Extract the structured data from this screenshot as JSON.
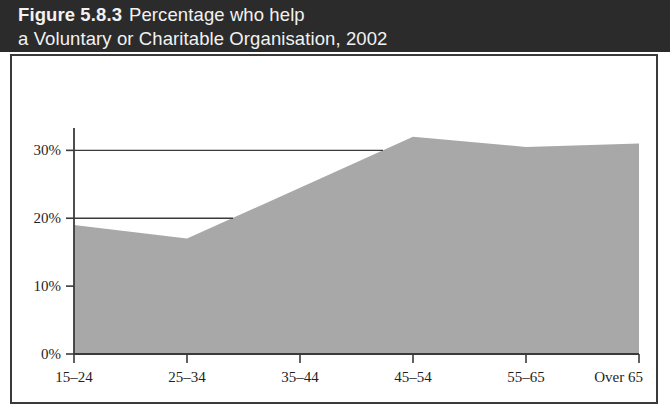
{
  "title": {
    "label": "Figure 5.8.3",
    "line1_rest": "Percentage who help",
    "line2": "a Voluntary or Charitable Organisation, 2002"
  },
  "colors": {
    "title_band": "#2b2b2b",
    "title_text": "#f2f2f2",
    "panel_border": "#3a3a3a",
    "area_fill": "#a8a8a8",
    "axis": "#3a3a3a",
    "gridline": "#3a3a3a",
    "panel_background": "#ffffff"
  },
  "chart_data": {
    "type": "area",
    "xlabel": "",
    "ylabel": "",
    "categories": [
      "15–24",
      "25–34",
      "35–44",
      "45–54",
      "55–65",
      "Over 65"
    ],
    "values": [
      19,
      17,
      24.5,
      32,
      30.5,
      31
    ],
    "ylim": [
      0,
      33
    ],
    "yticks": [
      0,
      10,
      20,
      30
    ],
    "ytick_labels": [
      "0%",
      "10%",
      "20%",
      "30%"
    ],
    "grid": true,
    "gridlines_at": [
      20,
      30
    ],
    "legend": "none",
    "series": [
      {
        "name": "Percentage who help a Voluntary or Charitable Organisation",
        "values": [
          19,
          17,
          24.5,
          32,
          30.5,
          31
        ]
      }
    ]
  }
}
